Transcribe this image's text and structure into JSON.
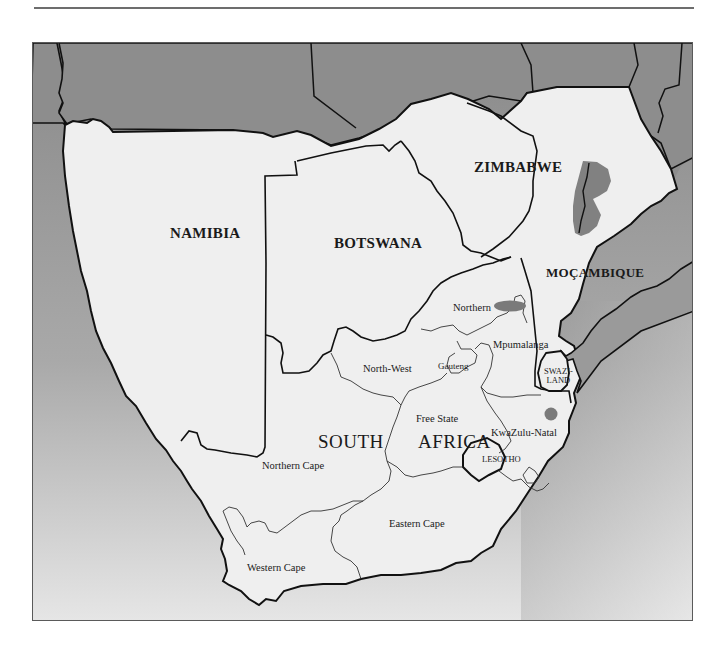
{
  "header": {
    "running_head": "DISTRIBUTION"
  },
  "map": {
    "title": "Southern Africa distribution map",
    "colors": {
      "sea_top": "#8a8a8a",
      "sea_bottom": "#e4e4e4",
      "land_outside": "#8c8c8c",
      "land_focus": "#efefef",
      "border": "#111111",
      "province_border": "#333333",
      "distribution": "#7a7a7a"
    },
    "countries": [
      {
        "name": "NAMIBIA",
        "x": 170,
        "y": 232
      },
      {
        "name": "BOTSWANA",
        "x": 334,
        "y": 242
      },
      {
        "name": "ZIMBABWE",
        "x": 474,
        "y": 166
      },
      {
        "name": "MOÇAMBIQUE",
        "x": 546,
        "y": 271
      },
      {
        "name": "SWAZI-\nLAND",
        "x": 544,
        "y": 370
      },
      {
        "name": "LESOTHO",
        "x": 481,
        "y": 457
      }
    ],
    "country_main": {
      "name_a": "SOUTH",
      "name_b": "AFRICA"
    },
    "provinces": [
      {
        "name": "Northern",
        "x": 453,
        "y": 302
      },
      {
        "name": "Mpumalanga",
        "x": 493,
        "y": 339
      },
      {
        "name": "North-West",
        "x": 363,
        "y": 363
      },
      {
        "name": "Gauteng",
        "x": 438,
        "y": 360
      },
      {
        "name": "Free State",
        "x": 416,
        "y": 413
      },
      {
        "name": "KwaZulu-Natal",
        "x": 492,
        "y": 427
      },
      {
        "name": "Northern Cape",
        "x": 262,
        "y": 460
      },
      {
        "name": "Eastern Cape",
        "x": 389,
        "y": 518
      },
      {
        "name": "Western Cape",
        "x": 246,
        "y": 562
      }
    ],
    "distribution_areas": [
      "eastern Zimbabwe / Moçambique border highlands",
      "Northern Province (Soutpansberg)",
      "northern KwaZulu-Natal"
    ]
  }
}
